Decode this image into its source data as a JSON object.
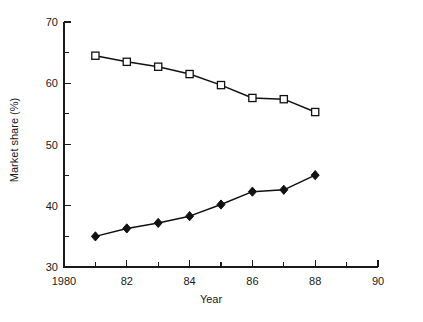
{
  "chart_data": {
    "type": "line",
    "title": "",
    "xlabel": "Year",
    "ylabel": "Market share (%)",
    "xlim": [
      1980,
      1990
    ],
    "ylim": [
      30,
      70
    ],
    "grid": false,
    "legend_position": "none",
    "x": [
      1981,
      1982,
      1983,
      1984,
      1985,
      1986,
      1987,
      1988
    ],
    "xtick_labels": [
      "1980",
      "82",
      "84",
      "86",
      "88",
      "90"
    ],
    "xtick_values": [
      1980,
      1982,
      1984,
      1986,
      1988,
      1990
    ],
    "xtick_minor_values": [
      1981,
      1983,
      1985,
      1987,
      1989
    ],
    "ytick_labels": [
      "30",
      "40",
      "50",
      "60",
      "70"
    ],
    "ytick_values": [
      30,
      40,
      50,
      60,
      70
    ],
    "ytick_minor_values": [
      35,
      45,
      55,
      65
    ],
    "series": [
      {
        "name": "upper-series",
        "marker": "open-square",
        "values": [
          64.5,
          63.5,
          62.7,
          61.5,
          59.7,
          57.6,
          57.4,
          55.3
        ]
      },
      {
        "name": "lower-series",
        "marker": "filled-diamond",
        "values": [
          35.0,
          36.3,
          37.2,
          38.3,
          40.2,
          42.3,
          42.6,
          45.0
        ]
      }
    ],
    "colors": {
      "line": "#111111",
      "marker_fill_open": "#ffffff",
      "marker_fill_closed": "#111111",
      "axis": "#1a1a1a",
      "background": "#ffffff"
    }
  }
}
